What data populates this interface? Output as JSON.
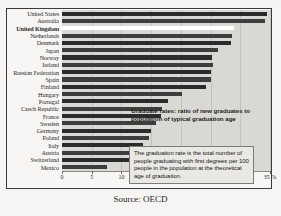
{
  "figure": {
    "clipped_title": "",
    "source_note": "Source: OECD"
  },
  "annotations": {
    "caption": "Graduate rates: ratio of new graduates to population of typical graduation age",
    "note_box": "The graduation rate is the total number of people graduating with first degrees per 100 people in the population at the theoretical age of graduation."
  },
  "colors": {
    "bar": "#2b2b2b",
    "bar_alt": "#3d3d3d",
    "highlight_bar": "#ffffff",
    "plot_background": "#d9d8d4",
    "frame": "#3a3a3a",
    "page_background": "#f6f5f3"
  },
  "chart_data": {
    "type": "bar",
    "orientation": "horizontal",
    "title": "",
    "xlabel": "%",
    "ylabel": "",
    "xlim": [
      0,
      35
    ],
    "xticks": [
      0,
      5,
      10,
      15,
      20,
      25,
      30,
      35
    ],
    "xticklabels": [
      "0",
      "5",
      "10",
      "15",
      "20",
      "25",
      "30",
      "35 %"
    ],
    "grid": true,
    "legend": "none",
    "highlight_category": "United Kingdom",
    "categories": [
      "United States",
      "Australia",
      "United Kingdom",
      "Netherlands",
      "Denmark",
      "Japan",
      "Norway",
      "Ireland",
      "Russian Federation",
      "Spain",
      "Finland",
      "Hungary",
      "Portugal",
      "Czech Republic",
      "France",
      "Sweden",
      "Germany",
      "Poland",
      "Italy",
      "Austria",
      "Switzerland",
      "Mexico"
    ],
    "values": [
      34.5,
      34.2,
      29.0,
      28.6,
      28.4,
      26.2,
      25.2,
      25.4,
      25.0,
      25.0,
      24.2,
      20.2,
      17.8,
      16.8,
      16.6,
      15.9,
      15.0,
      14.6,
      13.7,
      13.1,
      12.2,
      7.6
    ]
  }
}
